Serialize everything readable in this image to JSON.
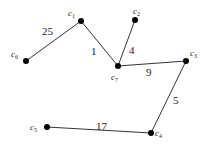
{
  "graph": {
    "nodes": [
      {
        "id": "c1",
        "name": "c",
        "sub": "1",
        "x": 81,
        "y": 21,
        "lx": 68,
        "ly": 16
      },
      {
        "id": "c2",
        "name": "c",
        "sub": "2",
        "x": 135,
        "y": 20,
        "lx": 133,
        "ly": 14
      },
      {
        "id": "c3",
        "name": "c",
        "sub": "3",
        "x": 186,
        "y": 61,
        "lx": 190,
        "ly": 56
      },
      {
        "id": "c4",
        "name": "c",
        "sub": "4",
        "x": 151,
        "y": 133,
        "lx": 155,
        "ly": 136
      },
      {
        "id": "c5",
        "name": "c",
        "sub": "5",
        "x": 47,
        "y": 127,
        "lx": 30,
        "ly": 130
      },
      {
        "id": "c6",
        "name": "c",
        "sub": "6",
        "x": 26,
        "y": 61,
        "lx": 11,
        "ly": 57
      },
      {
        "id": "c7",
        "name": "c",
        "sub": "7",
        "x": 118,
        "y": 66,
        "lx": 111,
        "ly": 80
      }
    ],
    "edges": [
      {
        "from": "c6",
        "to": "c1",
        "weight": "25",
        "lx": 42,
        "ly": 35
      },
      {
        "from": "c1",
        "to": "c7",
        "weight": "1",
        "lx": 91,
        "ly": 55
      },
      {
        "from": "c2",
        "to": "c7",
        "weight": "4",
        "lx": 129,
        "ly": 54
      },
      {
        "from": "c7",
        "to": "c3",
        "weight": "9",
        "lx": 146,
        "ly": 76
      },
      {
        "from": "c3",
        "to": "c4",
        "weight": "5",
        "lx": 173,
        "ly": 104
      },
      {
        "from": "c5",
        "to": "c4",
        "weight": "17",
        "lx": 96,
        "ly": 130
      }
    ]
  }
}
